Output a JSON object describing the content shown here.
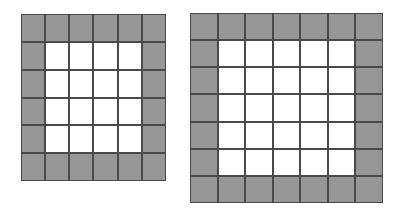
{
  "figure": {
    "name": "two-square-grids-with-shaded-border",
    "background_color": "#ffffff",
    "shaded_color": "#969696",
    "unshaded_color": "#ffffff",
    "gridline_color": "#4a4a4a",
    "caption": ""
  },
  "grids": [
    {
      "id": "left",
      "label": "Left grid",
      "rows": 6,
      "cols": 6,
      "total_cells": 36,
      "shaded_cells": 20,
      "unshaded_cells": 16,
      "inner_rows": 4,
      "inner_cols": 4,
      "border_ring_thickness": 1,
      "x": 21,
      "y": 14,
      "width": 145,
      "height": 167
    },
    {
      "id": "right",
      "label": "Right grid",
      "rows": 7,
      "cols": 7,
      "total_cells": 49,
      "shaded_cells": 24,
      "unshaded_cells": 25,
      "inner_rows": 5,
      "inner_cols": 5,
      "border_ring_thickness": 1,
      "x": 190,
      "y": 13,
      "width": 193,
      "height": 190
    }
  ]
}
